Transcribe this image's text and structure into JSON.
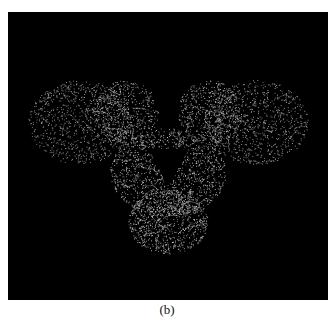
{
  "figure": {
    "caption": "(b)",
    "image_description": "3D mesh/wireframe rendering of a molecular density map on black background",
    "colors": {
      "background": "#000000",
      "mesh": "#d8d8d8"
    }
  }
}
